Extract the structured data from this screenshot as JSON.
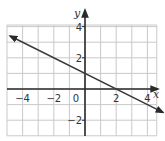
{
  "chart_data": {
    "type": "line",
    "title": "",
    "xlabel": "x",
    "ylabel": "y",
    "xlim": [
      -5,
      4
    ],
    "ylim": [
      -3,
      5
    ],
    "grid": true,
    "grid_step": 1,
    "x_ticks": [
      -4,
      -2,
      0,
      2,
      4
    ],
    "x_tick_labels": [
      "−4",
      "−2",
      "0",
      "2",
      "4"
    ],
    "y_ticks": [
      -2,
      2,
      4
    ],
    "y_tick_labels": [
      "−2",
      "2",
      "4"
    ],
    "series": [
      {
        "name": "line",
        "equation": "y = -x/2 + 1",
        "slope": -0.5,
        "intercept": 1,
        "x": [
          -4.8,
          5
        ],
        "y": [
          3.4,
          -1.5
        ],
        "arrows": "both",
        "color": "#3a3a3a"
      }
    ],
    "axis_arrows": [
      "x-positive",
      "y-positive"
    ]
  }
}
